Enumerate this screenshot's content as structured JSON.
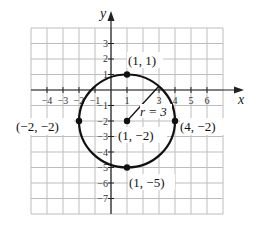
{
  "figure": {
    "type": "circle-graph",
    "axes": {
      "x_label": "x",
      "y_label": "y",
      "x_ticks": [
        {
          "value": -4,
          "label": "−4"
        },
        {
          "value": -3,
          "label": "−3"
        },
        {
          "value": -2,
          "label": "−2"
        },
        {
          "value": -1,
          "label": "−1"
        },
        {
          "value": 1,
          "label": "1"
        },
        {
          "value": 3,
          "label": "3"
        },
        {
          "value": 4,
          "label": "4"
        },
        {
          "value": 5,
          "label": "5"
        },
        {
          "value": 6,
          "label": "6"
        }
      ],
      "y_ticks": [
        {
          "value": 3,
          "label": "3"
        },
        {
          "value": 2,
          "label": "2"
        },
        {
          "value": 1,
          "label": "1"
        },
        {
          "value": -1,
          "label": "−1"
        },
        {
          "value": -2,
          "label": "−2"
        },
        {
          "value": -3,
          "label": "−3"
        },
        {
          "value": -4,
          "label": "−4"
        },
        {
          "value": -5,
          "label": "−5"
        },
        {
          "value": -6,
          "label": "−6"
        },
        {
          "value": -7,
          "label": "−7"
        }
      ],
      "grid": {
        "x_min": -5,
        "x_max": 7,
        "y_min": -8,
        "y_max": 4
      }
    },
    "circle": {
      "center": {
        "x": 1,
        "y": -2,
        "label": "(1, −2)"
      },
      "radius": 3,
      "radius_label": "r = 3"
    },
    "points": [
      {
        "x": 1,
        "y": 1,
        "label": "(1, 1)"
      },
      {
        "x": -2,
        "y": -2,
        "label": "(−2, −2)"
      },
      {
        "x": 4,
        "y": -2,
        "label": "(4, −2)"
      },
      {
        "x": 1,
        "y": -5,
        "label": "(1, −5)"
      }
    ],
    "colors": {
      "grid": "#bdbdbd",
      "axis": "#222222",
      "circle": "#111111",
      "background": "#ffffff"
    }
  }
}
